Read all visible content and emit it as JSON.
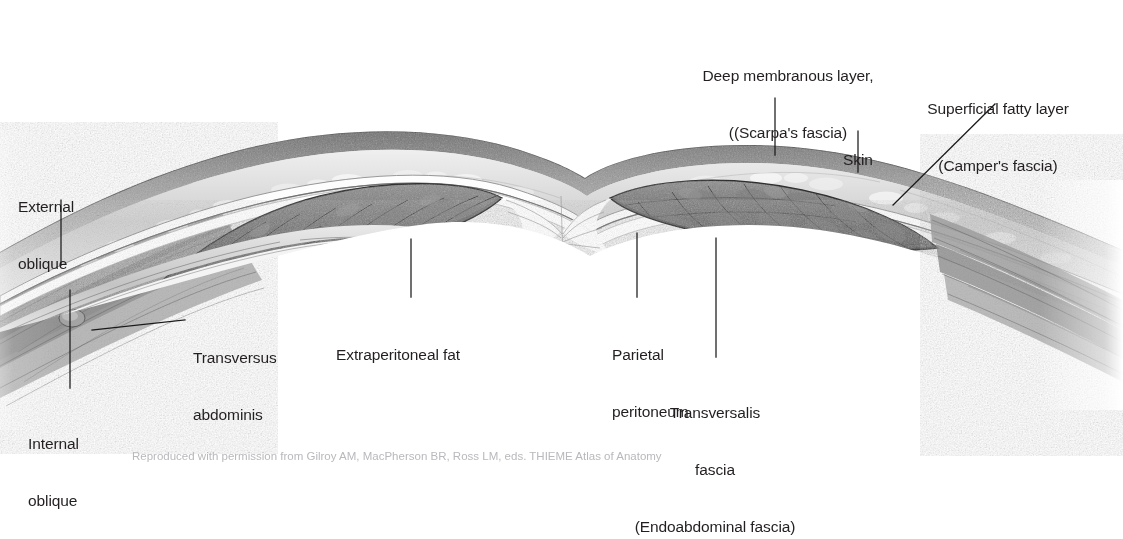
{
  "figure": {
    "background_color": "#ffffff",
    "ink_color": "#231f20",
    "leader_color": "#1a1a1a"
  },
  "labels": [
    {
      "id": "deep-membranous-layer",
      "lines": [
        "Deep membranous layer,",
        "((Scarpa's fascia)"
      ],
      "align": "center",
      "x": 668,
      "y": 28,
      "width": 240
    },
    {
      "id": "superficial-fatty-layer",
      "lines": [
        "Superficial fatty layer",
        "(Camper's fascia)"
      ],
      "align": "center",
      "x": 898,
      "y": 61,
      "width": 200
    },
    {
      "id": "skin",
      "lines": [
        "Skin"
      ],
      "align": "center",
      "x": 829,
      "y": 112,
      "width": 58
    },
    {
      "id": "external-oblique",
      "lines": [
        "External",
        "oblique"
      ],
      "align": "left",
      "x": 18,
      "y": 159,
      "width": 100
    },
    {
      "id": "extraperitoneal-fat",
      "lines": [
        "Extraperitoneal fat"
      ],
      "align": "left",
      "x": 336,
      "y": 307,
      "width": 170
    },
    {
      "id": "parietal-peritoneum",
      "lines": [
        "Parietal",
        "peritoneum"
      ],
      "align": "left",
      "x": 612,
      "y": 307,
      "width": 120
    },
    {
      "id": "transversus-abdominis",
      "lines": [
        "Transversus",
        "abdominis"
      ],
      "align": "left",
      "x": 193,
      "y": 310,
      "width": 130
    },
    {
      "id": "transversalis-fascia",
      "lines": [
        "Transversalis",
        "fascia",
        "(Endoabdominal fascia)"
      ],
      "align": "center",
      "x": 700,
      "y": 365,
      "width": 230
    },
    {
      "id": "internal-oblique",
      "lines": [
        "Internal",
        "oblique"
      ],
      "align": "left",
      "x": 28,
      "y": 396,
      "width": 100
    }
  ],
  "caption": {
    "text": "Reproduced with permission from Gilroy AM, MacPherson BR, Ross LM, eds. THIEME Atlas of Anatomy",
    "color": "#b9b9bd",
    "clipped": true
  },
  "leaders": [
    {
      "id": "leader-scarpa",
      "from": [
        775,
        98
      ],
      "to": [
        775,
        155
      ]
    },
    {
      "id": "leader-skin",
      "from": [
        858,
        131
      ],
      "to": [
        858,
        172
      ]
    },
    {
      "id": "leader-camper",
      "from": [
        995,
        104
      ],
      "to": [
        893,
        205
      ]
    },
    {
      "id": "leader-external-obl",
      "from": [
        61,
        200
      ],
      "to": [
        61,
        265
      ]
    },
    {
      "id": "leader-extraperit",
      "from": [
        411,
        239
      ],
      "to": [
        411,
        297
      ]
    },
    {
      "id": "leader-parietal",
      "from": [
        637,
        233
      ],
      "to": [
        637,
        297
      ]
    },
    {
      "id": "leader-transversus",
      "from": [
        185,
        320
      ],
      "to": [
        92,
        330
      ]
    },
    {
      "id": "leader-transversalis",
      "from": [
        716,
        238
      ],
      "to": [
        716,
        357
      ]
    },
    {
      "id": "leader-internal-obl",
      "from": [
        70,
        290
      ],
      "to": [
        70,
        388
      ]
    }
  ]
}
